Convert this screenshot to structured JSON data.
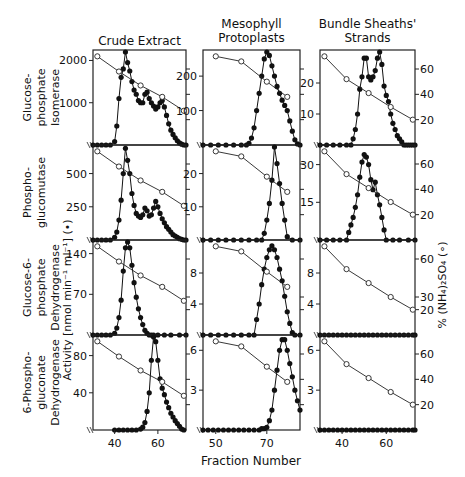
{
  "figure": {
    "columns": [
      "Crude Extract",
      "Mesophyll\nProtoplasts",
      "Bundle Sheaths'\nStrands"
    ],
    "row_labels": [
      [
        "Glucose-",
        "phosphate",
        "Isomerase"
      ],
      [
        "Phospho-",
        "glucomutase"
      ],
      [
        "Glucose-6-",
        "phosphate",
        "Dehydrogenase"
      ],
      [
        "6-Phospho-",
        "gluconate",
        "Dehydrogenase"
      ]
    ],
    "left_axis_label": "Activity  [nmol min⁻¹ ml⁻¹] (•)",
    "right_axis_label": "% (NH₄)₂SO₄ (∘)",
    "xlabel": "Fraction Number"
  },
  "chart_data": {
    "type": "line",
    "title": "",
    "xlabel": "Fraction Number",
    "ylabel_left": "Activity [nmol min-1 ml-1] (filled circles)",
    "ylabel_right": "% (NH4)2SO4 (open circles)",
    "columns": [
      {
        "name": "Crude Extract",
        "xlim": [
          30,
          73
        ],
        "xticks": [
          40,
          60
        ],
        "ammonium_sulfate": {
          "x": [
            32,
            42,
            52,
            62,
            72
          ],
          "y": [
            70,
            58,
            47,
            38,
            27
          ]
        }
      },
      {
        "name": "Mesophyll Protoplasts",
        "xlim": [
          45,
          83
        ],
        "xticks": [
          50,
          70
        ],
        "ammonium_sulfate": {
          "x": [
            50,
            60,
            70,
            78
          ],
          "y": [
            70,
            66,
            50,
            38
          ]
        }
      },
      {
        "name": "Bundle Sheaths' Strands",
        "xlim": [
          30,
          73
        ],
        "xticks": [
          40,
          60
        ],
        "ammonium_sulfate": {
          "x": [
            32,
            42,
            52,
            62,
            72
          ],
          "y": [
            70,
            52,
            41,
            30,
            20
          ]
        },
        "right_yticks": [
          20,
          40,
          60
        ]
      }
    ],
    "panels": [
      {
        "row": "Glucose-phosphate Isomerase",
        "column": "Crude Extract",
        "ylim": [
          0,
          2200
        ],
        "yticks": [
          1000,
          2000
        ],
        "x": [
          30,
          32,
          34,
          36,
          38,
          40,
          41,
          42,
          43,
          44,
          45,
          46,
          47,
          48,
          49,
          50,
          51,
          52,
          53,
          54,
          55,
          56,
          57,
          58,
          59,
          60,
          61,
          62,
          63,
          64,
          65,
          66,
          67,
          68,
          69,
          70,
          71,
          72,
          73
        ],
        "y": [
          0,
          0,
          0,
          0,
          0,
          80,
          450,
          1100,
          1600,
          1800,
          2200,
          1950,
          1750,
          1500,
          1300,
          1200,
          1050,
          1000,
          1000,
          1200,
          1250,
          1100,
          1000,
          920,
          850,
          900,
          1000,
          1050,
          900,
          700,
          500,
          350,
          250,
          170,
          100,
          50,
          20,
          0,
          0
        ]
      },
      {
        "row": "Glucose-phosphate Isomerase",
        "column": "Mesophyll Protoplasts",
        "ylim": [
          0,
          270
        ],
        "yticks": [
          100,
          200
        ],
        "x": [
          45,
          48,
          51,
          54,
          57,
          60,
          62,
          63,
          64,
          65,
          66,
          67,
          68,
          69,
          70,
          71,
          72,
          73,
          74,
          75,
          76,
          77,
          78,
          79,
          80,
          81,
          82,
          83
        ],
        "y": [
          0,
          0,
          0,
          0,
          0,
          0,
          0,
          5,
          20,
          50,
          100,
          150,
          200,
          250,
          270,
          260,
          230,
          200,
          170,
          150,
          130,
          115,
          100,
          70,
          40,
          15,
          3,
          0
        ]
      },
      {
        "row": "Glucose-phosphate Isomerase",
        "column": "Bundle Sheaths' Strands",
        "ylim": [
          0,
          30
        ],
        "yticks": [
          10,
          20
        ],
        "x": [
          30,
          33,
          36,
          39,
          42,
          44,
          45,
          46,
          47,
          48,
          49,
          50,
          51,
          52,
          53,
          54,
          55,
          56,
          57,
          58,
          59,
          60,
          61,
          62,
          63,
          64,
          65,
          66,
          67,
          68,
          69,
          70,
          71,
          72,
          73
        ],
        "y": [
          0,
          0,
          0,
          0,
          0,
          0,
          2,
          5,
          10,
          18,
          22,
          28,
          28,
          22,
          21,
          22,
          24,
          28,
          30,
          26,
          19,
          16,
          14,
          10,
          7,
          5,
          3,
          2,
          1,
          0,
          0,
          0,
          0,
          0,
          0
        ]
      },
      {
        "row": "Phosphoglucomutase",
        "column": "Crude Extract",
        "ylim": [
          0,
          700
        ],
        "yticks": [
          250,
          500
        ],
        "x": [
          30,
          32,
          34,
          36,
          38,
          40,
          41,
          42,
          43,
          44,
          45,
          46,
          47,
          48,
          49,
          50,
          51,
          52,
          53,
          54,
          55,
          56,
          57,
          58,
          59,
          60,
          61,
          62,
          63,
          64,
          65,
          66,
          67,
          68,
          69,
          70,
          71,
          72,
          73
        ],
        "y": [
          0,
          0,
          0,
          0,
          0,
          20,
          60,
          150,
          300,
          500,
          690,
          600,
          500,
          350,
          260,
          200,
          180,
          170,
          190,
          240,
          220,
          180,
          190,
          240,
          290,
          250,
          200,
          160,
          130,
          100,
          80,
          60,
          40,
          30,
          20,
          10,
          5,
          0,
          0
        ]
      },
      {
        "row": "Phosphoglucomutase",
        "column": "Mesophyll Protoplasts",
        "ylim": [
          0,
          28
        ],
        "yticks": [
          10,
          20
        ],
        "x": [
          45,
          48,
          51,
          54,
          57,
          60,
          63,
          66,
          68,
          69,
          70,
          71,
          72,
          73,
          74,
          75,
          76,
          77,
          78,
          80,
          83
        ],
        "y": [
          0,
          0,
          0,
          0,
          0,
          0,
          0,
          0,
          0,
          2,
          6,
          11,
          18,
          28,
          23,
          17,
          11,
          6,
          1,
          0,
          0
        ]
      },
      {
        "row": "Phosphoglucomutase",
        "column": "Bundle Sheaths' Strands",
        "ylim": [
          0,
          37
        ],
        "yticks": [
          15,
          30
        ],
        "x": [
          30,
          33,
          36,
          39,
          42,
          43,
          44,
          45,
          46,
          47,
          48,
          49,
          50,
          51,
          52,
          53,
          54,
          55,
          56,
          57,
          58,
          59,
          60,
          63,
          66,
          70,
          73
        ],
        "y": [
          0,
          0,
          0,
          0,
          0,
          3,
          6,
          9,
          13,
          18,
          25,
          31,
          34,
          33,
          30,
          24,
          20,
          23,
          18,
          14,
          9,
          4,
          0,
          0,
          0,
          0,
          0
        ]
      },
      {
        "row": "Glucose-6-phosphate Dehydrogenase",
        "column": "Crude Extract",
        "ylim": [
          0,
          160
        ],
        "yticks": [
          70,
          140
        ],
        "x": [
          30,
          32,
          34,
          36,
          38,
          40,
          41,
          42,
          43,
          44,
          45,
          46,
          47,
          48,
          49,
          50,
          51,
          52,
          53,
          54,
          55,
          56,
          57,
          58,
          60,
          63,
          66,
          70,
          73
        ],
        "y": [
          0,
          0,
          0,
          0,
          0,
          3,
          12,
          30,
          60,
          110,
          150,
          160,
          150,
          120,
          90,
          65,
          45,
          30,
          18,
          8,
          3,
          0,
          0,
          0,
          0,
          0,
          0,
          0,
          0
        ]
      },
      {
        "row": "Glucose-6-phosphate Dehydrogenase",
        "column": "Mesophyll Protoplasts",
        "ylim": [
          0,
          12
        ],
        "yticks": [
          4,
          8
        ],
        "x": [
          45,
          48,
          51,
          54,
          57,
          60,
          63,
          65,
          66,
          67,
          68,
          69,
          70,
          71,
          72,
          73,
          74,
          75,
          76,
          77,
          78,
          79,
          80,
          81,
          83
        ],
        "y": [
          0,
          0,
          0,
          0,
          0,
          0,
          0,
          0,
          2,
          4,
          6.5,
          8.5,
          10,
          11,
          11.5,
          11,
          10,
          8.5,
          7,
          5,
          3,
          1.5,
          0.3,
          0,
          0
        ]
      },
      {
        "row": "Glucose-6-phosphate Dehydrogenase",
        "column": "Bundle Sheaths' Strands",
        "ylim": [
          0,
          12
        ],
        "yticks": [
          4,
          8
        ],
        "x": [
          30,
          32,
          34,
          36,
          38,
          40,
          42,
          44,
          46,
          48,
          50,
          52,
          54,
          56,
          58,
          60,
          62,
          64,
          66,
          68,
          70,
          72,
          73
        ],
        "y": [
          0,
          0,
          0,
          0,
          0,
          0,
          0,
          0,
          0,
          0,
          0,
          0,
          0,
          0,
          0,
          0,
          0,
          0,
          0,
          0,
          0,
          0,
          0
        ]
      },
      {
        "row": "6-Phosphogluconate Dehydrogenase",
        "column": "Crude Extract",
        "ylim": [
          0,
          100
        ],
        "yticks": [
          40,
          80
        ],
        "x": [
          40,
          42,
          44,
          46,
          48,
          50,
          52,
          53,
          54,
          55,
          56,
          57,
          58,
          59,
          60,
          61,
          62,
          63,
          64,
          65,
          66,
          67,
          68,
          69,
          70,
          71,
          72
        ],
        "y": [
          0,
          0,
          0,
          0,
          0,
          0,
          1,
          3,
          8,
          20,
          40,
          75,
          100,
          95,
          75,
          55,
          45,
          38,
          30,
          24,
          18,
          14,
          10,
          7,
          4,
          1,
          0
        ]
      },
      {
        "row": "6-Phosphogluconate Dehydrogenase",
        "column": "Mesophyll Protoplasts",
        "ylim": [
          0,
          7
        ],
        "yticks": [
          3,
          6
        ],
        "x": [
          45,
          47,
          49,
          51,
          53,
          55,
          57,
          59,
          61,
          63,
          65,
          67,
          68,
          69,
          70,
          71,
          72,
          73,
          74,
          75,
          76,
          77,
          78,
          79,
          80,
          81,
          82,
          83
        ],
        "y": [
          0,
          0,
          0,
          0,
          0,
          0,
          0,
          0,
          0,
          0,
          0,
          0,
          0.1,
          0.1,
          0.2,
          0.7,
          1.5,
          3,
          4.5,
          6,
          6.8,
          6.8,
          6,
          5,
          4,
          3,
          2.2,
          1.5
        ]
      },
      {
        "row": "6-Phosphogluconate Dehydrogenase",
        "column": "Bundle Sheaths' Strands",
        "ylim": [
          0,
          7
        ],
        "yticks": [
          3,
          6
        ],
        "x": [
          30,
          32,
          34,
          36,
          38,
          40,
          42,
          44,
          46,
          48,
          50,
          52,
          54,
          56,
          58,
          60,
          62,
          64,
          66,
          68,
          70,
          72,
          73
        ],
        "y": [
          0,
          0,
          0,
          0,
          0,
          0,
          0,
          0,
          0,
          0,
          0,
          0,
          0,
          0,
          0,
          0,
          0,
          0,
          0,
          0,
          0,
          0,
          0
        ]
      }
    ],
    "right_axis": {
      "rows": [
        {
          "yticks": [
            20,
            40,
            60
          ]
        },
        {
          "yticks": [
            20,
            40,
            60
          ]
        },
        {
          "yticks": [
            20,
            30,
            60
          ]
        },
        {
          "yticks": [
            20,
            40,
            60
          ]
        }
      ]
    },
    "grid": false,
    "legend": "none"
  }
}
